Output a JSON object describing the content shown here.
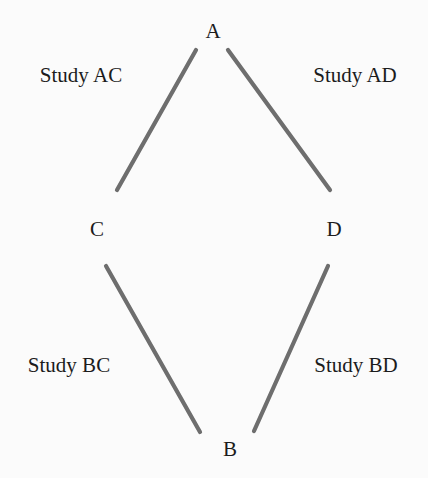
{
  "diagram": {
    "type": "network-diagram",
    "colors": {
      "background": "#fbfbfb",
      "edge": "#6e6e6e",
      "text": "#1c1c1c"
    },
    "nodes": [
      {
        "id": "A",
        "label": "A",
        "x": 213,
        "y": 31
      },
      {
        "id": "C",
        "label": "C",
        "x": 97,
        "y": 229
      },
      {
        "id": "D",
        "label": "D",
        "x": 334,
        "y": 229
      },
      {
        "id": "B",
        "label": "B",
        "x": 230,
        "y": 449
      }
    ],
    "edges": [
      {
        "id": "AC",
        "from": "A",
        "to": "C",
        "label": "Study AC",
        "x1": 196,
        "y1": 50,
        "x2": 117,
        "y2": 190,
        "label_x": 81,
        "label_y": 75
      },
      {
        "id": "AD",
        "from": "A",
        "to": "D",
        "label": "Study AD",
        "x1": 228,
        "y1": 50,
        "x2": 330,
        "y2": 190,
        "label_x": 355,
        "label_y": 75
      },
      {
        "id": "BC",
        "from": "B",
        "to": "C",
        "label": "Study BC",
        "x1": 200,
        "y1": 432,
        "x2": 106,
        "y2": 266,
        "label_x": 69,
        "label_y": 365
      },
      {
        "id": "BD",
        "from": "B",
        "to": "D",
        "label": "Study BD",
        "x1": 254,
        "y1": 431,
        "x2": 328,
        "y2": 266,
        "label_x": 356,
        "label_y": 365
      }
    ]
  }
}
